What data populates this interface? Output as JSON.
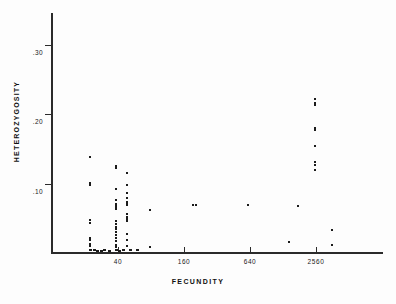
{
  "chart_data": {
    "type": "scatter",
    "title": "",
    "xlabel": "FECUNDITY",
    "ylabel": "HETEROZYGOSITY",
    "x_scale": "log",
    "x_ticks": [
      40,
      160,
      640,
      2560
    ],
    "x_tick_labels": [
      "40",
      "160",
      "640",
      "2560"
    ],
    "y_ticks": [
      0.1,
      0.2,
      0.3
    ],
    "y_tick_labels": [
      ".10",
      ".20",
      ".30"
    ],
    "ylim": [
      0.0,
      0.345
    ],
    "xlim": [
      10,
      10240
    ],
    "grid": false,
    "legend": null,
    "marker": "square-dot",
    "marker_color": "#1b1b1b",
    "points": [
      {
        "x": 22,
        "y": 0.138
      },
      {
        "x": 22,
        "y": 0.101
      },
      {
        "x": 22,
        "y": 0.098
      },
      {
        "x": 22,
        "y": 0.048
      },
      {
        "x": 22,
        "y": 0.043
      },
      {
        "x": 22,
        "y": 0.022
      },
      {
        "x": 22,
        "y": 0.019
      },
      {
        "x": 22,
        "y": 0.013
      },
      {
        "x": 22,
        "y": 0.01
      },
      {
        "x": 22,
        "y": 0.004
      },
      {
        "x": 24,
        "y": 0.004
      },
      {
        "x": 26,
        "y": 0.003
      },
      {
        "x": 28,
        "y": 0.003
      },
      {
        "x": 30,
        "y": 0.004
      },
      {
        "x": 33,
        "y": 0.003
      },
      {
        "x": 38,
        "y": 0.125
      },
      {
        "x": 38,
        "y": 0.122
      },
      {
        "x": 38,
        "y": 0.092
      },
      {
        "x": 38,
        "y": 0.077
      },
      {
        "x": 38,
        "y": 0.071
      },
      {
        "x": 38,
        "y": 0.069
      },
      {
        "x": 38,
        "y": 0.066
      },
      {
        "x": 38,
        "y": 0.064
      },
      {
        "x": 38,
        "y": 0.046
      },
      {
        "x": 38,
        "y": 0.042
      },
      {
        "x": 38,
        "y": 0.038
      },
      {
        "x": 38,
        "y": 0.034
      },
      {
        "x": 38,
        "y": 0.03
      },
      {
        "x": 38,
        "y": 0.026
      },
      {
        "x": 38,
        "y": 0.022
      },
      {
        "x": 38,
        "y": 0.018
      },
      {
        "x": 38,
        "y": 0.012
      },
      {
        "x": 38,
        "y": 0.008
      },
      {
        "x": 38,
        "y": 0.004
      },
      {
        "x": 41,
        "y": 0.003
      },
      {
        "x": 44,
        "y": 0.004
      },
      {
        "x": 48,
        "y": 0.116
      },
      {
        "x": 48,
        "y": 0.098
      },
      {
        "x": 48,
        "y": 0.086
      },
      {
        "x": 48,
        "y": 0.079
      },
      {
        "x": 48,
        "y": 0.074
      },
      {
        "x": 48,
        "y": 0.072
      },
      {
        "x": 48,
        "y": 0.07
      },
      {
        "x": 48,
        "y": 0.056
      },
      {
        "x": 48,
        "y": 0.052
      },
      {
        "x": 48,
        "y": 0.049
      },
      {
        "x": 48,
        "y": 0.046
      },
      {
        "x": 48,
        "y": 0.028
      },
      {
        "x": 48,
        "y": 0.019
      },
      {
        "x": 48,
        "y": 0.01
      },
      {
        "x": 52,
        "y": 0.004
      },
      {
        "x": 60,
        "y": 0.004
      },
      {
        "x": 78,
        "y": 0.062
      },
      {
        "x": 78,
        "y": 0.009
      },
      {
        "x": 195,
        "y": 0.069
      },
      {
        "x": 205,
        "y": 0.07
      },
      {
        "x": 620,
        "y": 0.07
      },
      {
        "x": 1450,
        "y": 0.016
      },
      {
        "x": 1750,
        "y": 0.068
      },
      {
        "x": 2520,
        "y": 0.223
      },
      {
        "x": 2520,
        "y": 0.216
      },
      {
        "x": 2520,
        "y": 0.213
      },
      {
        "x": 2520,
        "y": 0.181
      },
      {
        "x": 2520,
        "y": 0.177
      },
      {
        "x": 2520,
        "y": 0.154
      },
      {
        "x": 2520,
        "y": 0.131
      },
      {
        "x": 2520,
        "y": 0.127
      },
      {
        "x": 2520,
        "y": 0.12
      },
      {
        "x": 3600,
        "y": 0.033
      },
      {
        "x": 3600,
        "y": 0.012
      }
    ]
  }
}
